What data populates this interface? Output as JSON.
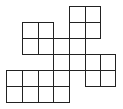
{
  "diagram": {
    "type": "grid-polyomino",
    "cell_count": 20,
    "col_edges": [
      6,
      22,
      38,
      53,
      69,
      85,
      100,
      115
    ],
    "row_edges": [
      6,
      22,
      38,
      54,
      70,
      86,
      102
    ],
    "line_color": "#222222",
    "cells": [
      [
        0,
        4
      ],
      [
        0,
        5
      ],
      [
        1,
        1
      ],
      [
        1,
        2
      ],
      [
        1,
        4
      ],
      [
        1,
        5
      ],
      [
        2,
        1
      ],
      [
        2,
        2
      ],
      [
        2,
        3
      ],
      [
        2,
        4
      ],
      [
        3,
        3
      ],
      [
        3,
        4
      ],
      [
        3,
        5
      ],
      [
        3,
        6
      ],
      [
        4,
        0
      ],
      [
        4,
        1
      ],
      [
        4,
        2
      ],
      [
        4,
        3
      ],
      [
        4,
        5
      ],
      [
        4,
        6
      ],
      [
        5,
        0
      ],
      [
        5,
        1
      ],
      [
        5,
        2
      ],
      [
        5,
        3
      ]
    ]
  }
}
